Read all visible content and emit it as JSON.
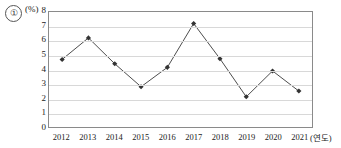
{
  "choice": {
    "marker_label": "①"
  },
  "axis": {
    "y_unit_label": "(%)",
    "x_unit_label": "(연도)"
  },
  "chart_data": {
    "type": "line",
    "title": "",
    "xlabel": "(연도)",
    "ylabel": "(%)",
    "categories": [
      "2012",
      "2013",
      "2014",
      "2015",
      "2016",
      "2017",
      "2018",
      "2019",
      "2020",
      "2021"
    ],
    "values": [
      4.7,
      6.2,
      4.4,
      2.8,
      4.15,
      7.2,
      4.75,
      2.1,
      3.9,
      2.5
    ],
    "ylim": [
      0,
      8
    ],
    "ytick_labels": [
      "0",
      "1",
      "2",
      "3",
      "4",
      "5",
      "6",
      "7",
      "8"
    ],
    "ytick_values": [
      0,
      1,
      2,
      3,
      4,
      5,
      6,
      7,
      8
    ],
    "grid": true,
    "legend": "none",
    "marker": "diamond",
    "line_color": "#4a4a4a",
    "marker_color": "#333333",
    "grid_color": "#d8d8d8",
    "border_color": "#8a8a8a"
  }
}
